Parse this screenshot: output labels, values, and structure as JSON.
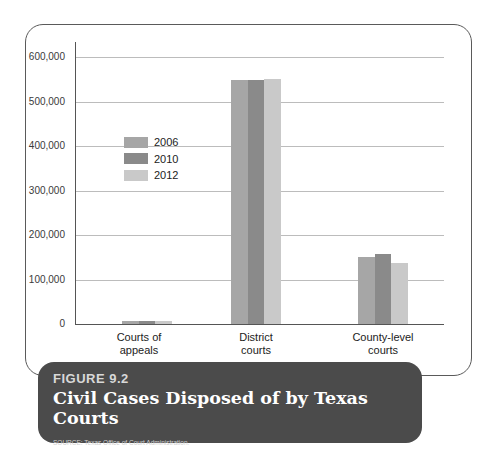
{
  "chart_data": {
    "type": "bar",
    "title": "Civil Cases Disposed of by Texas Courts",
    "figure_label": "FIGURE 9.2",
    "source": "SOURCE: Texas Office of Court Administration.",
    "xlabel": "",
    "ylabel": "",
    "ylim": [
      0,
      600000
    ],
    "yticks": [
      "0",
      "100,000",
      "200,000",
      "300,000",
      "400,000",
      "500,000",
      "600,000"
    ],
    "grid": true,
    "legend_position": "upper-left inside plot",
    "categories": [
      "Courts of appeals",
      "District courts",
      "County-level courts"
    ],
    "series": [
      {
        "name": "2006",
        "color": "#a6a6a6",
        "values": [
          7000,
          548000,
          150000
        ]
      },
      {
        "name": "2010",
        "color": "#8a8a8a",
        "values": [
          7000,
          549000,
          157000
        ]
      },
      {
        "name": "2012",
        "color": "#c9c9c9",
        "values": [
          7000,
          550000,
          137000
        ]
      }
    ]
  },
  "labels": {
    "cat0_line1": "Courts of",
    "cat0_line2": "appeals",
    "cat1_line1": "District",
    "cat1_line2": "courts",
    "cat2_line1": "County-level",
    "cat2_line2": "courts"
  }
}
